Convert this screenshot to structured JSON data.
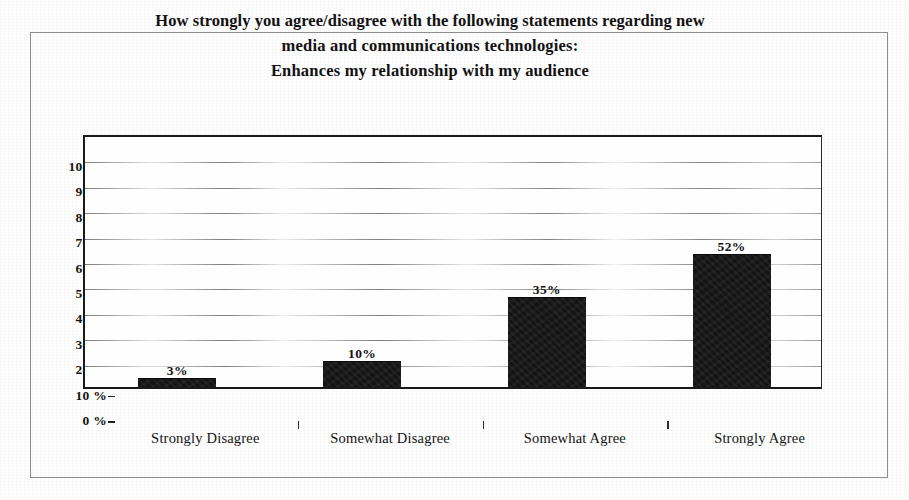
{
  "chart_data": {
    "type": "bar",
    "title": "How strongly you agree/disagree with the following statements regarding new media and communications technologies: Enhances my relationship with my audience",
    "title_lines": [
      "How strongly you agree/disagree with the following statements regarding new",
      "media and communications technologies:",
      "Enhances my relationship with my audience"
    ],
    "categories": [
      "Strongly Disagree",
      "Somewhat Disagree",
      "Somewhat Agree",
      "Strongly Agree"
    ],
    "values": [
      3,
      10,
      35,
      52
    ],
    "value_labels": [
      "3%",
      "10%",
      "35%",
      "52%"
    ],
    "xlabel": "",
    "ylabel": "",
    "ylim": [
      0,
      100
    ],
    "y_tick_values": [
      100,
      90,
      80,
      70,
      60,
      50,
      40,
      30,
      20,
      10,
      0
    ],
    "y_tick_labels": [
      "100 %",
      "90 %",
      "80 %",
      "70 %",
      "60 %",
      "50 %",
      "40 %",
      "30 %",
      "20 %",
      "10 %",
      "0 %"
    ],
    "grid": true,
    "legend": false,
    "bar_color": "#141414",
    "axis_color": "#1a1a1a",
    "grid_color": "#787878",
    "background_color": "#fefefe"
  }
}
